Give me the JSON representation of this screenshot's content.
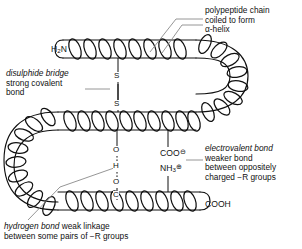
{
  "diagram": {
    "stroke_color": "#101010",
    "leader_color": "#8a8a8a",
    "background": "#ffffff"
  },
  "annotations": {
    "polypeptide": {
      "line1": "polypeptide chain",
      "line2": "coiled to form",
      "line3": "α-helix"
    },
    "disulphide": {
      "emphasis": "disulphide bridge",
      "line2": "strong covalent",
      "line3": "bond"
    },
    "electrovalent": {
      "emphasis": "electrovalent bond",
      "line2": "weaker bond",
      "line3": "between oppositely",
      "line4": "charged −R groups"
    },
    "hydrogen": {
      "emphasis": "hydrogen bond",
      "rest": " weak linkage",
      "line2": "between some pairs of −R groups"
    }
  },
  "chain_labels": {
    "n_terminus": "H",
    "n_terminus_sub": "2",
    "n_terminus_tail": "N",
    "c_terminus": "COOH",
    "carboxylate": "COO",
    "carboxylate_charge": "⊖",
    "amino": "NH",
    "amino_sub": "3",
    "amino_charge": "⊕"
  },
  "atoms": {
    "sulphur_top": "S",
    "sulphur_bottom": "S",
    "oxygen_top": "O",
    "hydrogen": "H",
    "oxygen_bottom": "O",
    "carbon": "C"
  }
}
